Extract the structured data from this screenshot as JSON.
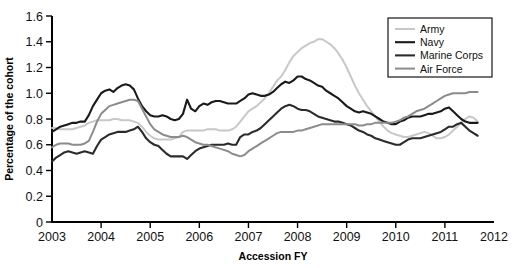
{
  "chart_data": {
    "type": "line",
    "title": "",
    "xlabel": "Accession FY",
    "ylabel": "Percentage of the cohort",
    "xlim": [
      2003,
      2012
    ],
    "ylim": [
      0,
      1.6
    ],
    "xticks": [
      2003,
      2004,
      2005,
      2006,
      2007,
      2008,
      2009,
      2010,
      2011,
      2012
    ],
    "xtick_labels": [
      "2003",
      "2004",
      "2005",
      "2006",
      "2007",
      "2008",
      "2009",
      "2010",
      "2011",
      "2012"
    ],
    "yticks": [
      0,
      0.2,
      0.4,
      0.6,
      0.8,
      1.0,
      1.2,
      1.4,
      1.6
    ],
    "ytick_labels": [
      "0",
      "0.2",
      "0.4",
      "0.6",
      "0.8",
      "1.0",
      "1.2",
      "1.4",
      "1.6"
    ],
    "grid": false,
    "legend_position": "top-right",
    "x": [
      2003.0,
      2003.083,
      2003.167,
      2003.25,
      2003.333,
      2003.417,
      2003.5,
      2003.583,
      2003.667,
      2003.75,
      2003.833,
      2003.917,
      2004.0,
      2004.083,
      2004.167,
      2004.25,
      2004.333,
      2004.417,
      2004.5,
      2004.583,
      2004.667,
      2004.75,
      2004.833,
      2004.917,
      2005.0,
      2005.083,
      2005.167,
      2005.25,
      2005.333,
      2005.417,
      2005.5,
      2005.583,
      2005.667,
      2005.75,
      2005.833,
      2005.917,
      2006.0,
      2006.083,
      2006.167,
      2006.25,
      2006.333,
      2006.417,
      2006.5,
      2006.583,
      2006.667,
      2006.75,
      2006.833,
      2006.917,
      2007.0,
      2007.083,
      2007.167,
      2007.25,
      2007.333,
      2007.417,
      2007.5,
      2007.583,
      2007.667,
      2007.75,
      2007.833,
      2007.917,
      2008.0,
      2008.083,
      2008.167,
      2008.25,
      2008.333,
      2008.417,
      2008.5,
      2008.583,
      2008.667,
      2008.75,
      2008.833,
      2008.917,
      2009.0,
      2009.083,
      2009.167,
      2009.25,
      2009.333,
      2009.417,
      2009.5,
      2009.583,
      2009.667,
      2009.75,
      2009.833,
      2009.917,
      2010.0,
      2010.083,
      2010.167,
      2010.25,
      2010.333,
      2010.417,
      2010.5,
      2010.583,
      2010.667,
      2010.75,
      2010.833,
      2010.917,
      2011.0,
      2011.083,
      2011.167,
      2011.25,
      2011.333,
      2011.417,
      2011.5,
      2011.583,
      2011.667
    ],
    "series": [
      {
        "name": "Army",
        "color": "#c8c8c8",
        "width": 2.0,
        "values": [
          0.73,
          0.73,
          0.72,
          0.72,
          0.72,
          0.72,
          0.73,
          0.74,
          0.75,
          0.77,
          0.78,
          0.79,
          0.79,
          0.79,
          0.79,
          0.8,
          0.8,
          0.79,
          0.79,
          0.79,
          0.78,
          0.77,
          0.74,
          0.7,
          0.67,
          0.65,
          0.64,
          0.64,
          0.64,
          0.64,
          0.65,
          0.66,
          0.7,
          0.71,
          0.71,
          0.71,
          0.71,
          0.71,
          0.72,
          0.72,
          0.72,
          0.71,
          0.71,
          0.71,
          0.72,
          0.74,
          0.78,
          0.82,
          0.86,
          0.88,
          0.9,
          0.93,
          0.96,
          1.0,
          1.05,
          1.1,
          1.13,
          1.18,
          1.24,
          1.29,
          1.32,
          1.35,
          1.37,
          1.39,
          1.4,
          1.42,
          1.42,
          1.4,
          1.38,
          1.35,
          1.31,
          1.26,
          1.2,
          1.13,
          1.06,
          1.0,
          0.95,
          0.9,
          0.86,
          0.82,
          0.78,
          0.74,
          0.71,
          0.69,
          0.68,
          0.67,
          0.66,
          0.66,
          0.67,
          0.68,
          0.69,
          0.7,
          0.69,
          0.67,
          0.65,
          0.65,
          0.66,
          0.68,
          0.71,
          0.74,
          0.77,
          0.8,
          0.82,
          0.81,
          0.78
        ]
      },
      {
        "name": "Navy",
        "color": "#1a1a1a",
        "width": 2.1,
        "values": [
          0.7,
          0.72,
          0.74,
          0.75,
          0.76,
          0.77,
          0.77,
          0.78,
          0.78,
          0.83,
          0.9,
          0.95,
          1.0,
          1.02,
          1.03,
          1.01,
          1.04,
          1.06,
          1.07,
          1.06,
          1.03,
          0.96,
          0.9,
          0.86,
          0.83,
          0.82,
          0.82,
          0.83,
          0.82,
          0.8,
          0.79,
          0.8,
          0.84,
          0.95,
          0.88,
          0.86,
          0.9,
          0.92,
          0.91,
          0.93,
          0.94,
          0.94,
          0.93,
          0.92,
          0.92,
          0.92,
          0.94,
          0.96,
          0.99,
          1.0,
          0.99,
          0.98,
          0.98,
          0.99,
          1.01,
          1.04,
          1.07,
          1.09,
          1.08,
          1.1,
          1.13,
          1.13,
          1.11,
          1.1,
          1.08,
          1.06,
          1.05,
          1.02,
          1.0,
          0.98,
          0.96,
          0.93,
          0.9,
          0.88,
          0.86,
          0.85,
          0.86,
          0.85,
          0.84,
          0.82,
          0.8,
          0.78,
          0.77,
          0.76,
          0.76,
          0.78,
          0.79,
          0.81,
          0.82,
          0.82,
          0.82,
          0.83,
          0.84,
          0.84,
          0.85,
          0.86,
          0.88,
          0.89,
          0.86,
          0.83,
          0.8,
          0.78,
          0.77,
          0.77,
          0.77
        ]
      },
      {
        "name": "Marine Corps",
        "color": "#2b2b2b",
        "width": 2.1,
        "values": [
          0.47,
          0.5,
          0.52,
          0.54,
          0.55,
          0.54,
          0.53,
          0.54,
          0.55,
          0.54,
          0.53,
          0.59,
          0.64,
          0.66,
          0.68,
          0.69,
          0.7,
          0.7,
          0.7,
          0.71,
          0.72,
          0.74,
          0.7,
          0.65,
          0.62,
          0.6,
          0.59,
          0.56,
          0.53,
          0.51,
          0.51,
          0.51,
          0.51,
          0.49,
          0.52,
          0.55,
          0.57,
          0.58,
          0.59,
          0.6,
          0.6,
          0.6,
          0.6,
          0.61,
          0.6,
          0.6,
          0.66,
          0.68,
          0.68,
          0.7,
          0.71,
          0.73,
          0.76,
          0.79,
          0.82,
          0.85,
          0.88,
          0.9,
          0.91,
          0.9,
          0.88,
          0.87,
          0.87,
          0.86,
          0.84,
          0.82,
          0.81,
          0.8,
          0.79,
          0.78,
          0.78,
          0.77,
          0.76,
          0.75,
          0.73,
          0.71,
          0.7,
          0.68,
          0.67,
          0.65,
          0.64,
          0.63,
          0.62,
          0.61,
          0.6,
          0.6,
          0.62,
          0.64,
          0.65,
          0.65,
          0.65,
          0.66,
          0.67,
          0.68,
          0.69,
          0.7,
          0.72,
          0.74,
          0.74,
          0.76,
          0.77,
          0.74,
          0.71,
          0.69,
          0.67
        ]
      },
      {
        "name": "Air Force",
        "color": "#8c8c8c",
        "width": 2.0,
        "values": [
          0.58,
          0.6,
          0.61,
          0.61,
          0.61,
          0.6,
          0.6,
          0.6,
          0.61,
          0.63,
          0.7,
          0.78,
          0.84,
          0.87,
          0.9,
          0.91,
          0.92,
          0.93,
          0.94,
          0.95,
          0.95,
          0.94,
          0.88,
          0.82,
          0.76,
          0.72,
          0.7,
          0.68,
          0.67,
          0.66,
          0.66,
          0.66,
          0.67,
          0.66,
          0.64,
          0.62,
          0.61,
          0.6,
          0.6,
          0.59,
          0.58,
          0.57,
          0.56,
          0.55,
          0.53,
          0.52,
          0.51,
          0.52,
          0.55,
          0.57,
          0.59,
          0.61,
          0.63,
          0.65,
          0.67,
          0.69,
          0.7,
          0.7,
          0.7,
          0.7,
          0.71,
          0.71,
          0.72,
          0.73,
          0.74,
          0.75,
          0.76,
          0.76,
          0.76,
          0.76,
          0.76,
          0.76,
          0.76,
          0.76,
          0.76,
          0.75,
          0.75,
          0.76,
          0.76,
          0.77,
          0.77,
          0.77,
          0.77,
          0.77,
          0.78,
          0.79,
          0.81,
          0.82,
          0.84,
          0.86,
          0.87,
          0.88,
          0.9,
          0.92,
          0.94,
          0.96,
          0.98,
          0.99,
          1.0,
          1.0,
          1.0,
          1.0,
          1.01,
          1.01,
          1.01
        ]
      }
    ]
  }
}
